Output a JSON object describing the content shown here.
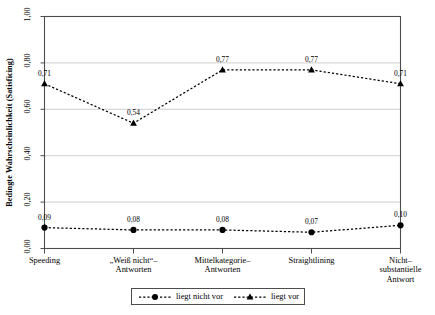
{
  "chart_data": {
    "type": "line",
    "title": "",
    "xlabel": "",
    "ylabel": "Bedingte Wahrscheinlichkeit (Satisficing)",
    "ylim": [
      0.0,
      1.0
    ],
    "ytick_values": [
      0.0,
      0.2,
      0.4,
      0.6,
      0.8,
      1.0
    ],
    "ytick_labels": [
      "0,00",
      "0,20",
      "0,40",
      "0,60",
      "0,80",
      "1,00"
    ],
    "grid": true,
    "grid_axis": "y",
    "legend_position": "bottom-center",
    "categories": [
      "Speeding",
      "„Weiß nicht“–\nAntworten",
      "Mittelkategorie–\nAntworten",
      "Straightlining",
      "Nicht–\nsubstantielle\nAntwort"
    ],
    "category_lines": [
      [
        "Speeding"
      ],
      [
        "„Weiß nicht“–",
        "Antworten"
      ],
      [
        "Mittelkategorie–",
        "Antworten"
      ],
      [
        "Straightlining"
      ],
      [
        "Nicht–",
        "substantielle",
        "Antwort"
      ]
    ],
    "series": [
      {
        "name": "liegt nicht vor",
        "marker": "circle",
        "linestyle": "dashed",
        "color": "#000000",
        "values": [
          0.09,
          0.08,
          0.08,
          0.07,
          0.1
        ],
        "labels": [
          "0,09",
          "0,08",
          "0,08",
          "0,07",
          "0,10"
        ]
      },
      {
        "name": "liegt vor",
        "marker": "triangle",
        "linestyle": "dashed",
        "color": "#000000",
        "values": [
          0.71,
          0.54,
          0.77,
          0.77,
          0.71
        ],
        "labels": [
          "0,71",
          "0,54",
          "0,77",
          "0,77",
          "0,71"
        ]
      }
    ]
  },
  "legend": {
    "entries": [
      {
        "label": "liegt nicht vor",
        "marker": "circle"
      },
      {
        "label": "liegt vor",
        "marker": "triangle"
      }
    ]
  },
  "colors": {
    "line": "#000000",
    "grid": "#c8c8c8",
    "frame": "#4d4d4d",
    "background": "#ffffff"
  }
}
